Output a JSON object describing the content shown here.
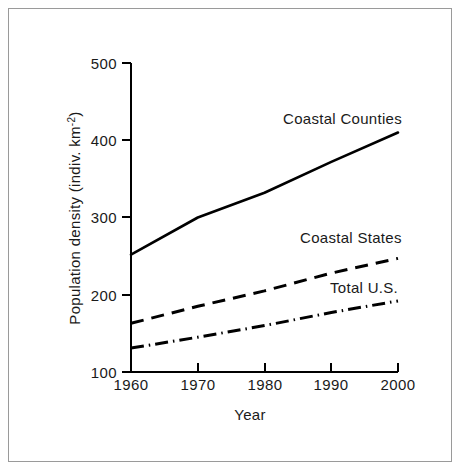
{
  "figure": {
    "background_color": "#ffffff",
    "frame_color": "#9a9a9a",
    "ink_color": "#000000"
  },
  "chart_data": {
    "type": "line",
    "title": "",
    "xlabel": "Year",
    "ylabel": "Population density (indiv. km",
    "ylabel_exponent": "-2",
    "ylabel_suffix": ")",
    "x": [
      1960,
      1970,
      1980,
      1990,
      2000
    ],
    "xtick_labels": [
      "1960",
      "1970",
      "1980",
      "1990",
      "2000"
    ],
    "ytick_labels": [
      "100",
      "200",
      "300",
      "400",
      "500"
    ],
    "yticks": [
      100,
      200,
      300,
      400,
      500
    ],
    "xlim": [
      1960,
      2000
    ],
    "ylim": [
      100,
      500
    ],
    "grid": false,
    "legend_position": "inline-annotations",
    "series": [
      {
        "name": "Coastal Counties",
        "line_style": "solid",
        "values": [
          252,
          300,
          332,
          372,
          410
        ],
        "label_text": "Coastal Counties"
      },
      {
        "name": "Coastal States",
        "line_style": "dashed",
        "values": [
          163,
          185,
          205,
          228,
          247
        ],
        "label_text": "Coastal States"
      },
      {
        "name": "Total U.S.",
        "line_style": "dash-dot",
        "values": [
          131,
          145,
          160,
          177,
          192
        ],
        "label_text": "Total U.S."
      }
    ]
  },
  "annotations": {
    "coastal_counties": "Coastal Counties",
    "coastal_states": "Coastal States",
    "total_us": "Total U.S."
  },
  "axes": {
    "x_title": "Year",
    "y_title_main": "Population density (indiv. km",
    "y_title_exp": "-2",
    "y_title_close": ")",
    "xticks": [
      "1960",
      "1970",
      "1980",
      "1990",
      "2000"
    ],
    "yticks": [
      "500",
      "400",
      "300",
      "200",
      "100"
    ]
  }
}
